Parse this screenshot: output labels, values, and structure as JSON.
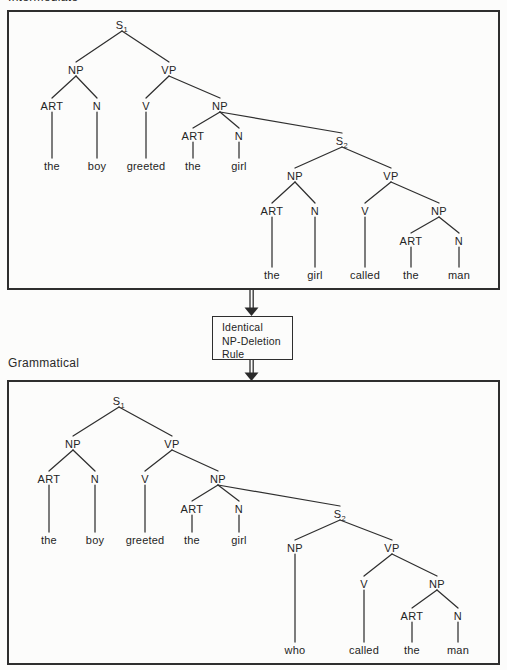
{
  "page": {
    "top_label": "Intermediate",
    "bottom_label": "Grammatical"
  },
  "rule_box": {
    "lines": [
      "Identical",
      "NP-Deletion",
      "Rule"
    ]
  },
  "colors": {
    "line": "#2f2f2f",
    "text": "#242424",
    "background": "#fcfcfb"
  },
  "icons": [
    "down-double-arrow"
  ],
  "trees": {
    "intermediate": {
      "nodes": [
        {
          "id": "S1",
          "t": "S",
          "sub": "1",
          "x": 113,
          "y": 13
        },
        {
          "id": "NP1",
          "t": "NP",
          "x": 67,
          "y": 58
        },
        {
          "id": "VP1",
          "t": "VP",
          "x": 160,
          "y": 58
        },
        {
          "id": "ART1",
          "t": "ART",
          "x": 43,
          "y": 94
        },
        {
          "id": "N1",
          "t": "N",
          "x": 88,
          "y": 94
        },
        {
          "id": "V1",
          "t": "V",
          "x": 137,
          "y": 94
        },
        {
          "id": "NP2",
          "t": "NP",
          "x": 211,
          "y": 94
        },
        {
          "id": "ART2",
          "t": "ART",
          "x": 184,
          "y": 124
        },
        {
          "id": "N2",
          "t": "N",
          "x": 230,
          "y": 124
        },
        {
          "id": "S2",
          "t": "S",
          "sub": "2",
          "x": 333,
          "y": 129
        },
        {
          "id": "NP3",
          "t": "NP",
          "x": 286,
          "y": 164
        },
        {
          "id": "VP2",
          "t": "VP",
          "x": 382,
          "y": 164
        },
        {
          "id": "ART3",
          "t": "ART",
          "x": 263,
          "y": 199
        },
        {
          "id": "N3",
          "t": "N",
          "x": 306,
          "y": 199
        },
        {
          "id": "V2",
          "t": "V",
          "x": 356,
          "y": 199
        },
        {
          "id": "NP4",
          "t": "NP",
          "x": 430,
          "y": 199
        },
        {
          "id": "ART4",
          "t": "ART",
          "x": 402,
          "y": 229
        },
        {
          "id": "N4",
          "t": "N",
          "x": 450,
          "y": 229
        },
        {
          "id": "w1",
          "t": "the",
          "x": 43,
          "y": 154,
          "word": true
        },
        {
          "id": "w2",
          "t": "boy",
          "x": 88,
          "y": 154,
          "word": true
        },
        {
          "id": "w3",
          "t": "greeted",
          "x": 137,
          "y": 154,
          "word": true
        },
        {
          "id": "w4",
          "t": "the",
          "x": 184,
          "y": 154,
          "word": true
        },
        {
          "id": "w5",
          "t": "girl",
          "x": 230,
          "y": 154,
          "word": true
        },
        {
          "id": "w6",
          "t": "the",
          "x": 263,
          "y": 263,
          "word": true
        },
        {
          "id": "w7",
          "t": "girl",
          "x": 306,
          "y": 263,
          "word": true
        },
        {
          "id": "w8",
          "t": "called",
          "x": 356,
          "y": 263,
          "word": true
        },
        {
          "id": "w9",
          "t": "the",
          "x": 402,
          "y": 263,
          "word": true
        },
        {
          "id": "w10",
          "t": "man",
          "x": 450,
          "y": 263,
          "word": true
        }
      ],
      "edges": [
        [
          "S1",
          "NP1"
        ],
        [
          "S1",
          "VP1"
        ],
        [
          "NP1",
          "ART1"
        ],
        [
          "NP1",
          "N1"
        ],
        [
          "VP1",
          "V1"
        ],
        [
          "VP1",
          "NP2"
        ],
        [
          "NP2",
          "ART2"
        ],
        [
          "NP2",
          "N2"
        ],
        [
          "NP2",
          "S2"
        ],
        [
          "ART1",
          "w1"
        ],
        [
          "N1",
          "w2"
        ],
        [
          "V1",
          "w3"
        ],
        [
          "ART2",
          "w4"
        ],
        [
          "N2",
          "w5"
        ],
        [
          "S2",
          "NP3"
        ],
        [
          "S2",
          "VP2"
        ],
        [
          "NP3",
          "ART3"
        ],
        [
          "NP3",
          "N3"
        ],
        [
          "VP2",
          "V2"
        ],
        [
          "VP2",
          "NP4"
        ],
        [
          "NP4",
          "ART4"
        ],
        [
          "NP4",
          "N4"
        ],
        [
          "ART3",
          "w6"
        ],
        [
          "N3",
          "w7"
        ],
        [
          "V2",
          "w8"
        ],
        [
          "ART4",
          "w9"
        ],
        [
          "N4",
          "w10"
        ]
      ]
    },
    "grammatical": {
      "nodes": [
        {
          "id": "S1",
          "t": "S",
          "sub": "1",
          "x": 110,
          "y": 19
        },
        {
          "id": "NP1",
          "t": "NP",
          "x": 64,
          "y": 62
        },
        {
          "id": "VP1",
          "t": "VP",
          "x": 163,
          "y": 62
        },
        {
          "id": "ART1",
          "t": "ART",
          "x": 40,
          "y": 97
        },
        {
          "id": "N1",
          "t": "N",
          "x": 86,
          "y": 97
        },
        {
          "id": "V1",
          "t": "V",
          "x": 136,
          "y": 97
        },
        {
          "id": "NP2",
          "t": "NP",
          "x": 209,
          "y": 97
        },
        {
          "id": "ART2",
          "t": "ART",
          "x": 183,
          "y": 127
        },
        {
          "id": "N2",
          "t": "N",
          "x": 230,
          "y": 127
        },
        {
          "id": "S2",
          "t": "S",
          "sub": "2",
          "x": 331,
          "y": 132
        },
        {
          "id": "NP3",
          "t": "NP",
          "x": 286,
          "y": 166
        },
        {
          "id": "VP2",
          "t": "VP",
          "x": 383,
          "y": 166
        },
        {
          "id": "V2",
          "t": "V",
          "x": 355,
          "y": 202
        },
        {
          "id": "NP4",
          "t": "NP",
          "x": 428,
          "y": 202
        },
        {
          "id": "ART4",
          "t": "ART",
          "x": 403,
          "y": 234
        },
        {
          "id": "N4",
          "t": "N",
          "x": 449,
          "y": 234
        },
        {
          "id": "w1",
          "t": "the",
          "x": 40,
          "y": 158,
          "word": true
        },
        {
          "id": "w2",
          "t": "boy",
          "x": 86,
          "y": 158,
          "word": true
        },
        {
          "id": "w3",
          "t": "greeted",
          "x": 136,
          "y": 158,
          "word": true
        },
        {
          "id": "w4",
          "t": "the",
          "x": 183,
          "y": 158,
          "word": true
        },
        {
          "id": "w5",
          "t": "girl",
          "x": 230,
          "y": 158,
          "word": true
        },
        {
          "id": "w6",
          "t": "who",
          "x": 286,
          "y": 268,
          "word": true
        },
        {
          "id": "w7",
          "t": "called",
          "x": 355,
          "y": 268,
          "word": true
        },
        {
          "id": "w8",
          "t": "the",
          "x": 403,
          "y": 268,
          "word": true
        },
        {
          "id": "w9",
          "t": "man",
          "x": 449,
          "y": 268,
          "word": true
        }
      ],
      "edges": [
        [
          "S1",
          "NP1"
        ],
        [
          "S1",
          "VP1"
        ],
        [
          "NP1",
          "ART1"
        ],
        [
          "NP1",
          "N1"
        ],
        [
          "VP1",
          "V1"
        ],
        [
          "VP1",
          "NP2"
        ],
        [
          "NP2",
          "ART2"
        ],
        [
          "NP2",
          "N2"
        ],
        [
          "NP2",
          "S2"
        ],
        [
          "ART1",
          "w1"
        ],
        [
          "N1",
          "w2"
        ],
        [
          "V1",
          "w3"
        ],
        [
          "ART2",
          "w4"
        ],
        [
          "N2",
          "w5"
        ],
        [
          "S2",
          "NP3"
        ],
        [
          "S2",
          "VP2"
        ],
        [
          "NP3",
          "w6"
        ],
        [
          "VP2",
          "V2"
        ],
        [
          "VP2",
          "NP4"
        ],
        [
          "NP4",
          "ART4"
        ],
        [
          "NP4",
          "N4"
        ],
        [
          "V2",
          "w7"
        ],
        [
          "ART4",
          "w8"
        ],
        [
          "N4",
          "w9"
        ]
      ]
    }
  }
}
